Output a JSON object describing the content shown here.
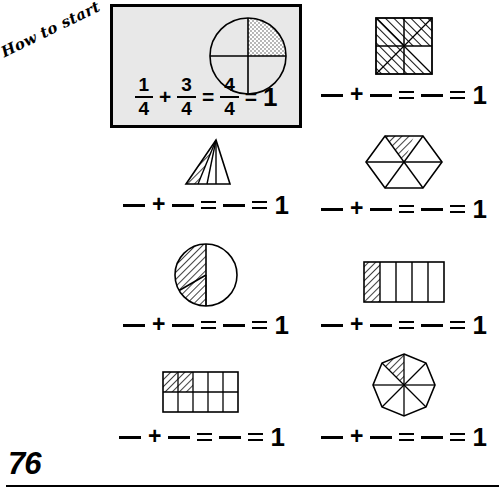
{
  "page": {
    "number": "76",
    "how_to_start_label": "How to start"
  },
  "example": {
    "figure": {
      "shape": "circle-quartered",
      "total_parts": 4,
      "shaded_parts": 1,
      "shading": "stipple"
    },
    "equation": {
      "term1": {
        "numerator": "1",
        "denominator": "4"
      },
      "operator": "+",
      "term2": {
        "numerator": "3",
        "denominator": "4"
      },
      "equals1": "=",
      "sum": {
        "numerator": "4",
        "denominator": "4"
      },
      "equals2": "=",
      "result": "1"
    }
  },
  "answer_line": {
    "blank1": "",
    "plus": "+",
    "blank2": "",
    "equals1": "=",
    "blank3": "",
    "equals2": "=",
    "result": "1"
  },
  "problems": [
    {
      "id": "problem-1",
      "figure": "triangle-quarters",
      "total_parts": 4,
      "shaded_parts": 1,
      "shading": "hatch"
    },
    {
      "id": "problem-2",
      "figure": "square-eighths",
      "total_parts": 8,
      "shaded_parts": 7,
      "shading": "hatch"
    },
    {
      "id": "problem-3",
      "figure": "circle-thirds",
      "total_parts": 3,
      "shaded_parts": 2,
      "shading": "hatch"
    },
    {
      "id": "problem-4",
      "figure": "hexagon-sixths",
      "total_parts": 6,
      "shaded_parts": 1,
      "shading": "hatch"
    },
    {
      "id": "problem-5",
      "figure": "rectangle-tenths",
      "total_parts": 10,
      "shaded_parts": 2,
      "shading": "hatch"
    },
    {
      "id": "problem-6",
      "figure": "rectangle-fifths",
      "total_parts": 5,
      "shaded_parts": 1,
      "shading": "hatch"
    },
    {
      "id": "problem-7",
      "figure": "octagon-eighths",
      "total_parts": 8,
      "shaded_parts": 1,
      "shading": "hatch"
    }
  ]
}
